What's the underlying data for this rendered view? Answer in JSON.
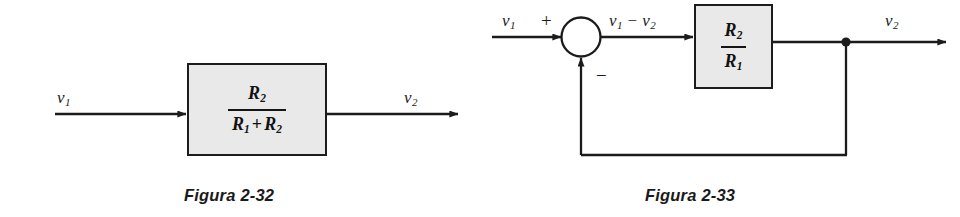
{
  "page": {
    "background_color": "#ffffff",
    "ink_color": "#1a1a1a",
    "block_fill_color": "#e9e9e9",
    "block_border_color": "#1c1c1c"
  },
  "figures": [
    {
      "id": "figura-2-32",
      "caption": "Figura 2-32",
      "type": "open-loop-block-diagram",
      "input_label": "v",
      "input_sub": "1",
      "output_label": "v",
      "output_sub": "2",
      "block": {
        "numerator": "R",
        "numerator_sub": "2",
        "denominator_left": "R",
        "denominator_left_sub": "1",
        "denominator_operator": "+",
        "denominator_right": "R",
        "denominator_right_sub": "2"
      }
    },
    {
      "id": "figura-2-33",
      "caption": "Figura 2-33",
      "type": "closed-loop-block-diagram",
      "input_label": "v",
      "input_sub": "1",
      "plus_sign": "+",
      "minus_sign": "−",
      "error_label_left": "v",
      "error_label_left_sub": "1",
      "error_operator": "−",
      "error_label_right": "v",
      "error_label_right_sub": "2",
      "output_label": "v",
      "output_sub": "2",
      "block": {
        "numerator": "R",
        "numerator_sub": "2",
        "denominator": "R",
        "denominator_sub": "1"
      },
      "summing_junction": "circle",
      "branch_node": "filled-dot"
    }
  ]
}
